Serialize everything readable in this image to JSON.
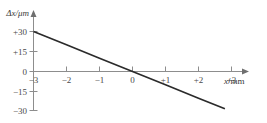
{
  "chart_data": {
    "type": "line",
    "title": "",
    "xlabel": "x/mm",
    "ylabel": "Δx/μm",
    "xlim": [
      -3.4,
      3.6
    ],
    "ylim": [
      -33,
      34
    ],
    "grid": false,
    "legend": null,
    "x_ticks": [
      -3,
      -2,
      -1,
      0,
      1,
      2,
      3
    ],
    "x_tick_labels": [
      "−3",
      "−2",
      "−1",
      "0",
      "+1",
      "+2",
      "+3"
    ],
    "y_ticks": [
      30,
      15,
      0,
      -15,
      -30
    ],
    "y_tick_labels": [
      "+30",
      "+15",
      "0",
      "−15",
      "−30"
    ],
    "series": [
      {
        "name": "Δx vs x",
        "x": [
          -3.0,
          2.8
        ],
        "values": [
          30,
          -28
        ],
        "slope": -10,
        "intercept": 0,
        "points": [
          {
            "x": -3.0,
            "y": 30
          },
          {
            "x": -2.0,
            "y": 20
          },
          {
            "x": -1.0,
            "y": 10
          },
          {
            "x": 0.0,
            "y": 0
          },
          {
            "x": 1.0,
            "y": -10
          },
          {
            "x": 2.0,
            "y": -20
          },
          {
            "x": 2.8,
            "y": -28
          }
        ]
      }
    ]
  },
  "axes": {
    "y_axis_title": "Δx/μm",
    "x_axis_title_var": "x",
    "x_axis_title_unit": "/mm"
  },
  "colors": {
    "line": "#2b2b2b",
    "axis": "#8d8d8d",
    "text": "#4a4a4a",
    "background": "#ffffff"
  }
}
